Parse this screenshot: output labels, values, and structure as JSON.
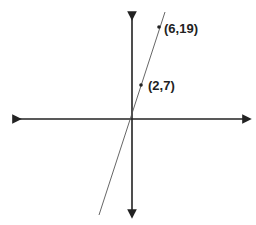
{
  "diagram": {
    "type": "coordinate-plane-line",
    "points": [
      {
        "label": "(2,7)",
        "x": 2,
        "y": 7
      },
      {
        "label": "(6,19)",
        "x": 6,
        "y": 19
      }
    ],
    "colors": {
      "axis": "#222222",
      "line": "#555555",
      "text": "#222222"
    }
  }
}
